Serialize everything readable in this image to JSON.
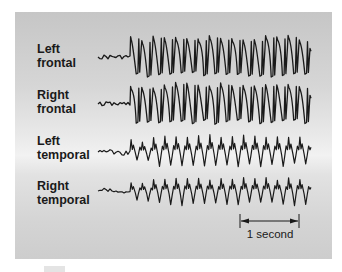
{
  "figure": {
    "panel_color_top": "#c6c6c6",
    "panel_color_mid": "#f2f2f2",
    "trace_color": "#1a1a1a"
  },
  "channels": [
    {
      "line1": "Left",
      "line2": "frontal"
    },
    {
      "line1": "Right",
      "line2": "frontal"
    },
    {
      "line1": "Left",
      "line2": "temporal"
    },
    {
      "line1": "Right",
      "line2": "temporal"
    }
  ],
  "scale_bar": {
    "label": "1 second",
    "x_start": 240,
    "x_end": 299,
    "y": 221
  },
  "chart_data": {
    "type": "line",
    "title": "",
    "xlabel": "",
    "ylabel": "",
    "grid": false,
    "legend": "none",
    "annotations": [
      "1 second"
    ],
    "series": [
      {
        "name": "Left frontal",
        "baseline_y": 57,
        "onset_x": 130,
        "end_x": 310,
        "pre_ictal": "low-amplitude irregular",
        "ictal": "high-amplitude rhythmic spike-wave",
        "cycles_after_onset": 16
      },
      {
        "name": "Right frontal",
        "baseline_y": 104,
        "onset_x": 130,
        "end_x": 310,
        "pre_ictal": "low-amplitude irregular",
        "ictal": "high-amplitude rhythmic spike-wave",
        "cycles_after_onset": 16
      },
      {
        "name": "Left temporal",
        "baseline_y": 152,
        "onset_x": 130,
        "end_x": 310,
        "pre_ictal": "low-amplitude irregular",
        "ictal": "medium-amplitude rhythmic spike-wave",
        "cycles_after_onset": 16
      },
      {
        "name": "Right temporal",
        "baseline_y": 191,
        "onset_x": 130,
        "end_x": 310,
        "pre_ictal": "low-amplitude irregular",
        "ictal": "lower-amplitude rhythmic spike-wave",
        "cycles_after_onset": 16
      }
    ],
    "time_scale": {
      "label": "1 second",
      "pixels": 59
    }
  }
}
